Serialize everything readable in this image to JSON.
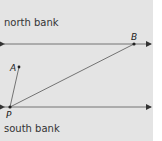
{
  "diagram": {
    "labels": {
      "north": "north bank",
      "south": "south bank"
    },
    "points": {
      "A": "A",
      "B": "B",
      "P": "P"
    },
    "colors": {
      "background": "#e4e4e4",
      "line": "#444444",
      "text": "#333333"
    }
  }
}
